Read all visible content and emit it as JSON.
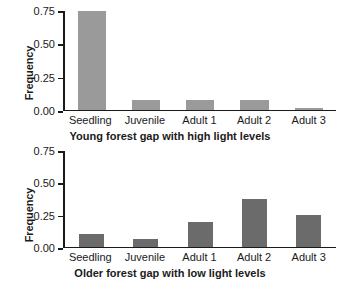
{
  "chart_data": [
    {
      "type": "bar",
      "title": "Young forest gap with high light levels",
      "xlabel": "",
      "ylabel": "Frequency",
      "categories": [
        "Seedling",
        "Juvenile",
        "Adult 1",
        "Adult 2",
        "Adult 3"
      ],
      "values": [
        0.75,
        0.07,
        0.075,
        0.075,
        0.01
      ],
      "ylim": [
        0.0,
        0.75
      ],
      "yticks": [
        0.0,
        0.25,
        0.5,
        0.75
      ],
      "ytick_labels": [
        "0.00",
        "0.25",
        "0.50",
        "0.75"
      ],
      "bar_color": "#9a9a9a",
      "grid": false,
      "legend": false
    },
    {
      "type": "bar",
      "title": "Older forest gap with low light levels",
      "xlabel": "",
      "ylabel": "Frequency",
      "categories": [
        "Seedling",
        "Juvenile",
        "Adult 1",
        "Adult 2",
        "Adult 3"
      ],
      "values": [
        0.095,
        0.06,
        0.19,
        0.375,
        0.25
      ],
      "ylim": [
        0.0,
        0.75
      ],
      "yticks": [
        0.0,
        0.25,
        0.5,
        0.75
      ],
      "ytick_labels": [
        "0.00",
        "0.25",
        "0.50",
        "0.75"
      ],
      "bar_color": "#6b6b6b",
      "grid": false,
      "legend": false
    }
  ]
}
